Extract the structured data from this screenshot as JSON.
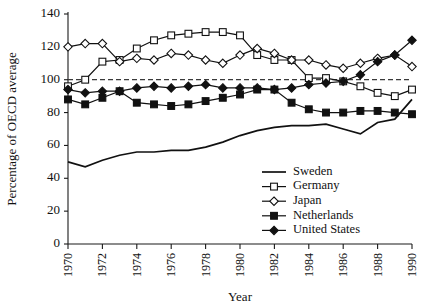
{
  "chart_data": {
    "type": "line",
    "title": "",
    "xlabel": "Year",
    "ylabel": "Percentage of OECD average",
    "xlim": [
      1970,
      1990
    ],
    "ylim": [
      0,
      140
    ],
    "ytick_step": 20,
    "yticks": [
      0,
      20,
      40,
      60,
      80,
      100,
      120,
      140
    ],
    "xticks": [
      1970,
      1972,
      1974,
      1976,
      1978,
      1980,
      1982,
      1984,
      1986,
      1988,
      1990
    ],
    "xtick_labels": [
      "1970",
      "1972",
      "1974",
      "1976",
      "1978",
      "1980",
      "1982",
      "1984",
      "1986",
      "1988",
      "1990"
    ],
    "x": [
      1970,
      1971,
      1972,
      1973,
      1974,
      1975,
      1976,
      1977,
      1978,
      1979,
      1980,
      1981,
      1982,
      1983,
      1984,
      1985,
      1986,
      1987,
      1988,
      1989,
      1990
    ],
    "grid": false,
    "reference_line": {
      "value": 100,
      "style": "dashed",
      "label": ""
    },
    "legend_position": "bottom-right",
    "series": [
      {
        "name": "Sweden",
        "marker": "none",
        "values": [
          50,
          47,
          51,
          54,
          56,
          56,
          57,
          57,
          59,
          62,
          66,
          69,
          71,
          72,
          72,
          73,
          70,
          67,
          74,
          76,
          88
        ]
      },
      {
        "name": "Germany",
        "marker": "open-square",
        "values": [
          96,
          100,
          111,
          112,
          119,
          124,
          127,
          128,
          129,
          129,
          127,
          115,
          112,
          112,
          101,
          101,
          99,
          96,
          92,
          90,
          94
        ]
      },
      {
        "name": "Japan",
        "marker": "open-diamond",
        "values": [
          120,
          122,
          122,
          111,
          113,
          112,
          116,
          115,
          112,
          110,
          115,
          119,
          116,
          112,
          112,
          109,
          107,
          110,
          113,
          115,
          108
        ]
      },
      {
        "name": "Netherlands",
        "marker": "solid-square",
        "values": [
          88,
          85,
          89,
          93,
          86,
          85,
          84,
          85,
          87,
          89,
          91,
          94,
          94,
          86,
          82,
          80,
          80,
          81,
          81,
          80,
          79
        ]
      },
      {
        "name": "United States",
        "marker": "solid-diamond",
        "values": [
          94,
          92,
          93,
          93,
          95,
          96,
          95,
          96,
          97,
          95,
          95,
          95,
          94,
          95,
          97,
          98,
          99,
          103,
          111,
          115,
          124
        ]
      }
    ]
  },
  "legend": {
    "items": [
      {
        "label": "Sweden"
      },
      {
        "label": "Germany"
      },
      {
        "label": "Japan"
      },
      {
        "label": "Netherlands"
      },
      {
        "label": "United States"
      }
    ]
  }
}
